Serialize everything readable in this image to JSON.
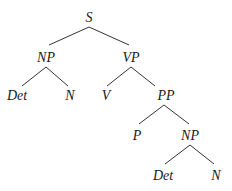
{
  "diagram": {
    "type": "syntax-tree",
    "colors": {
      "text": "#1a1a1a",
      "edge": "#333333",
      "background": "#ffffff"
    },
    "nodes": [
      {
        "id": "s",
        "label": "S",
        "x": 89,
        "y": 22
      },
      {
        "id": "np1",
        "label": "NP",
        "x": 46,
        "y": 62
      },
      {
        "id": "vp",
        "label": "VP",
        "x": 131,
        "y": 62
      },
      {
        "id": "det1",
        "label": "Det",
        "x": 17,
        "y": 100
      },
      {
        "id": "n1",
        "label": "N",
        "x": 70,
        "y": 100
      },
      {
        "id": "v",
        "label": "V",
        "x": 106,
        "y": 100
      },
      {
        "id": "pp",
        "label": "PP",
        "x": 166,
        "y": 100
      },
      {
        "id": "p",
        "label": "P",
        "x": 137,
        "y": 140
      },
      {
        "id": "np2",
        "label": "NP",
        "x": 190,
        "y": 140
      },
      {
        "id": "det2",
        "label": "Det",
        "x": 163,
        "y": 180
      },
      {
        "id": "n2",
        "label": "N",
        "x": 216,
        "y": 180
      }
    ],
    "edges": [
      {
        "from": "s",
        "to": "np1",
        "x1": 89,
        "y1": 27,
        "x2": 49,
        "y2": 45
      },
      {
        "from": "s",
        "to": "vp",
        "x1": 89,
        "y1": 27,
        "x2": 129,
        "y2": 45
      },
      {
        "from": "np1",
        "to": "det1",
        "x1": 46,
        "y1": 67,
        "x2": 22,
        "y2": 86
      },
      {
        "from": "np1",
        "to": "n1",
        "x1": 46,
        "y1": 67,
        "x2": 68,
        "y2": 86
      },
      {
        "from": "vp",
        "to": "v",
        "x1": 131,
        "y1": 67,
        "x2": 107,
        "y2": 86
      },
      {
        "from": "vp",
        "to": "pp",
        "x1": 131,
        "y1": 67,
        "x2": 155,
        "y2": 86
      },
      {
        "from": "pp",
        "to": "p",
        "x1": 164,
        "y1": 105,
        "x2": 139,
        "y2": 124
      },
      {
        "from": "pp",
        "to": "np2",
        "x1": 164,
        "y1": 105,
        "x2": 189,
        "y2": 124
      },
      {
        "from": "np2",
        "to": "det2",
        "x1": 190,
        "y1": 145,
        "x2": 165,
        "y2": 164
      },
      {
        "from": "np2",
        "to": "n2",
        "x1": 190,
        "y1": 145,
        "x2": 214,
        "y2": 164
      }
    ]
  }
}
